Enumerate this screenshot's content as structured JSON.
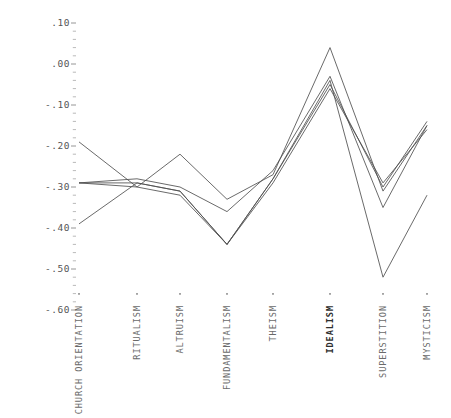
{
  "chart_data": {
    "type": "line",
    "title": "",
    "subtitle": "",
    "xlabel": "",
    "ylabel": "",
    "categories": [
      "CHURCH ORIENTATION",
      "RITUALISM",
      "ALTRUISM",
      "FUNDAMENTALISM",
      "THEISM",
      "IDEALISM",
      "SUPERSTITION",
      "MYSTICISM"
    ],
    "emphasized_category": "IDEALISM",
    "ylim": [
      -0.6,
      0.1
    ],
    "ytick_labels": [
      ".10",
      ".00",
      "-.10",
      "-.20",
      "-.30",
      "-.40",
      "-.50",
      "-.60"
    ],
    "ytick_values": [
      0.1,
      0.0,
      -0.1,
      -0.2,
      -0.3,
      -0.4,
      -0.5,
      -0.6
    ],
    "yminor_step": 0.02,
    "grid": false,
    "legend": "none",
    "series": [
      {
        "name": "series-1",
        "values": [
          -0.19,
          -0.3,
          -0.22,
          -0.33,
          -0.27,
          0.04,
          -0.31,
          -0.15
        ]
      },
      {
        "name": "series-2",
        "values": [
          -0.29,
          -0.28,
          -0.3,
          -0.36,
          -0.26,
          -0.03,
          -0.35,
          -0.15
        ]
      },
      {
        "name": "series-3",
        "values": [
          -0.29,
          -0.29,
          -0.31,
          -0.44,
          -0.28,
          -0.05,
          -0.3,
          -0.14
        ]
      },
      {
        "name": "series-4",
        "values": [
          -0.29,
          -0.3,
          -0.32,
          -0.44,
          -0.29,
          -0.06,
          -0.29,
          -0.16
        ]
      },
      {
        "name": "series-5",
        "values": [
          -0.39,
          -0.29,
          -0.31,
          -0.44,
          -0.28,
          -0.04,
          -0.52,
          -0.32
        ]
      }
    ]
  }
}
